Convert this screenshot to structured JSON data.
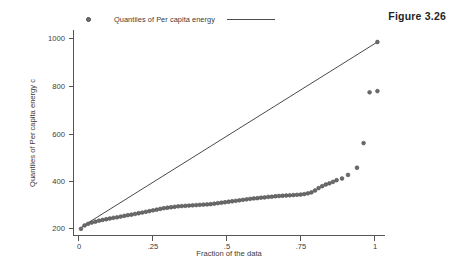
{
  "figure": {
    "label": "Figure 3.26"
  },
  "legend": {
    "marker_icon": "open-circle-marker",
    "entry_label": "Quantiles of Per capita energy",
    "line_icon": "reference-line-swatch"
  },
  "axes": {
    "y_title": "Quantiles of Per capita energy c",
    "x_title": "Fraction of the data",
    "y_ticks": [
      "200",
      "400",
      "600",
      "800",
      "1000"
    ],
    "x_ticks": [
      "0",
      ".25",
      ".5",
      ".75",
      "1"
    ]
  },
  "chart_data": {
    "type": "scatter",
    "title": "Figure 3.26",
    "xlabel": "Fraction of the data",
    "ylabel": "Quantiles of Per capita energy c",
    "xlim": [
      0,
      1.04
    ],
    "ylim": [
      170,
      1030
    ],
    "grid": false,
    "legend_position": "top-left",
    "legend_entries": [
      "Quantiles of Per capita energy"
    ],
    "series": [
      {
        "name": "Quantiles of Per capita energy",
        "type": "scatter",
        "marker": "open-circle",
        "x": [
          0.01,
          0.022,
          0.034,
          0.046,
          0.058,
          0.07,
          0.082,
          0.094,
          0.106,
          0.118,
          0.13,
          0.142,
          0.154,
          0.166,
          0.178,
          0.19,
          0.202,
          0.214,
          0.226,
          0.238,
          0.25,
          0.262,
          0.274,
          0.286,
          0.298,
          0.31,
          0.322,
          0.334,
          0.346,
          0.358,
          0.37,
          0.382,
          0.394,
          0.406,
          0.418,
          0.43,
          0.442,
          0.454,
          0.466,
          0.478,
          0.49,
          0.502,
          0.514,
          0.526,
          0.538,
          0.55,
          0.562,
          0.574,
          0.586,
          0.598,
          0.61,
          0.622,
          0.634,
          0.646,
          0.658,
          0.67,
          0.682,
          0.694,
          0.706,
          0.718,
          0.73,
          0.742,
          0.754,
          0.766,
          0.778,
          0.79,
          0.802,
          0.814,
          0.826,
          0.838,
          0.85,
          0.862,
          0.88,
          0.9,
          0.93,
          0.952,
          0.972,
          0.998
        ],
        "y": [
          200,
          214,
          221,
          226,
          230,
          234,
          237,
          240,
          243,
          246,
          248,
          251,
          254,
          257,
          259,
          262,
          265,
          268,
          271,
          274,
          277,
          280,
          283,
          286,
          288,
          290,
          292,
          294,
          295,
          296,
          297,
          298,
          299,
          300,
          301,
          302,
          303,
          305,
          307,
          309,
          311,
          313,
          315,
          317,
          319,
          321,
          323,
          325,
          327,
          328,
          330,
          331,
          333,
          334,
          336,
          337,
          338,
          339,
          340,
          341,
          342,
          343,
          345,
          348,
          352,
          360,
          370,
          378,
          385,
          390,
          396,
          403,
          410,
          425,
          455,
          558,
          770,
          775
        ],
        "extra_point_at_line_end": {
          "x": 0.998,
          "y": 980
        }
      },
      {
        "name": "reference line",
        "type": "line",
        "x": [
          0.012,
          0.998
        ],
        "y": [
          208,
          980
        ]
      }
    ]
  }
}
